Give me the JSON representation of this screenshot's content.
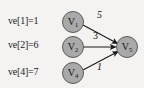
{
  "diagram": {
    "background_color": "#f4f3f1",
    "node_fill_color": "#a9a9a9",
    "node_border_color": "#5c5c5c",
    "edge_color": "#1a1a1a",
    "annotations": [
      {
        "id": "ve1",
        "text": "ve[1]=1"
      },
      {
        "id": "ve2",
        "text": "ve[2]=6"
      },
      {
        "id": "ve4",
        "text": "ve[4]=7"
      }
    ],
    "nodes": [
      {
        "id": "v1",
        "base": "V",
        "subscript": "1",
        "label": "V1"
      },
      {
        "id": "v2",
        "base": "V",
        "subscript": "2",
        "label": "V2"
      },
      {
        "id": "v4",
        "base": "V",
        "subscript": "4",
        "label": "V4"
      },
      {
        "id": "v5",
        "base": "V",
        "subscript": "5",
        "label": "V5"
      }
    ],
    "edges": [
      {
        "id": "e1",
        "from": "v1",
        "to": "v5",
        "weight": "5"
      },
      {
        "id": "e2",
        "from": "v2",
        "to": "v5",
        "weight": "3"
      },
      {
        "id": "e3",
        "from": "v4",
        "to": "v5",
        "weight": "1"
      }
    ]
  }
}
